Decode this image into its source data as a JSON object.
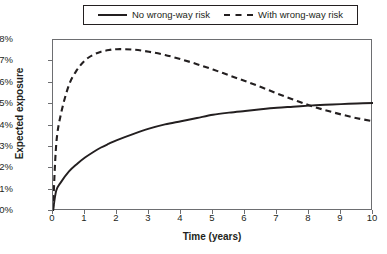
{
  "chart_data": {
    "type": "line",
    "title": "",
    "xlabel": "Time (years)",
    "ylabel": "Expected exposure",
    "xlim": [
      0,
      10
    ],
    "ylim": [
      0,
      8
    ],
    "grid": false,
    "legend_position": "top",
    "xticks": [
      "0",
      "1",
      "2",
      "3",
      "4",
      "5",
      "6",
      "7",
      "8",
      "9",
      "10"
    ],
    "yticks": [
      "0%",
      "1%",
      "2%",
      "3%",
      "4%",
      "5%",
      "6%",
      "7%",
      "8%"
    ],
    "x": [
      0,
      0.1,
      0.25,
      0.5,
      0.75,
      1,
      1.25,
      1.5,
      1.75,
      2,
      2.5,
      3,
      3.5,
      4,
      4.5,
      5,
      5.5,
      6,
      6.5,
      7,
      7.5,
      8,
      8.5,
      9,
      9.5,
      10
    ],
    "series": [
      {
        "name": "No wrong-way risk",
        "style": "solid",
        "color": "#231f20",
        "values": [
          0,
          0.95,
          1.35,
          1.85,
          2.2,
          2.5,
          2.75,
          2.97,
          3.15,
          3.32,
          3.6,
          3.85,
          4.05,
          4.2,
          4.35,
          4.5,
          4.6,
          4.68,
          4.76,
          4.83,
          4.88,
          4.93,
          4.97,
          5.0,
          5.03,
          5.05
        ]
      },
      {
        "name": "With wrong-way risk",
        "style": "dashed",
        "color": "#231f20",
        "values": [
          0,
          3.1,
          4.55,
          5.9,
          6.6,
          7.05,
          7.3,
          7.45,
          7.53,
          7.57,
          7.55,
          7.45,
          7.3,
          7.1,
          6.87,
          6.62,
          6.35,
          6.08,
          5.8,
          5.5,
          5.22,
          4.95,
          4.72,
          4.52,
          4.34,
          4.2
        ]
      }
    ],
    "annotations": {
      "peak_with_wwr": {
        "x": 2,
        "y": 7.57
      },
      "crossover": {
        "x": 8,
        "y": 4.95
      }
    }
  }
}
